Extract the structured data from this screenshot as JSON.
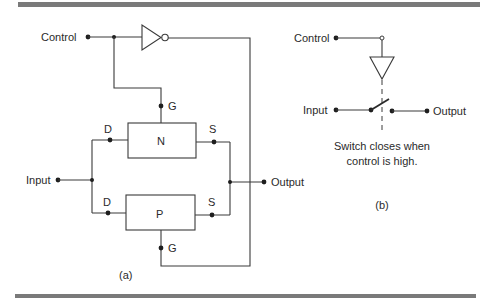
{
  "figure": {
    "rule_color": "#7a7a7a",
    "ink_color": "#2a2a2a",
    "panel_a": {
      "caption": "(a)",
      "control_label": "Control",
      "input_label": "Input",
      "output_label": "Output",
      "n_transistor": {
        "label": "N",
        "drain_label": "D",
        "source_label": "S",
        "gate_label": "G"
      },
      "p_transistor": {
        "label": "P",
        "drain_label": "D",
        "source_label": "S",
        "gate_label": "G"
      }
    },
    "panel_b": {
      "caption": "(b)",
      "control_label": "Control",
      "input_label": "Input",
      "output_label": "Output",
      "note_line1": "Switch closes when",
      "note_line2": "control is high."
    }
  }
}
